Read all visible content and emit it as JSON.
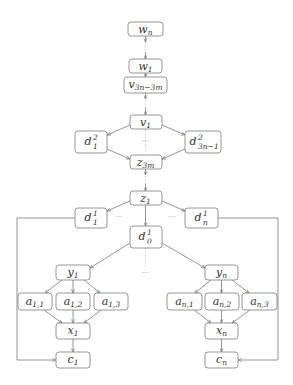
{
  "diagram": {
    "title": "",
    "nodes": [
      {
        "id": "wn",
        "base": "w",
        "sub": "n",
        "sup": ""
      },
      {
        "id": "w1",
        "base": "w",
        "sub": "1",
        "sup": ""
      },
      {
        "id": "v3n3m",
        "base": "v",
        "sub": "3n−3m",
        "sup": ""
      },
      {
        "id": "v1",
        "base": "v",
        "sub": "1",
        "sup": ""
      },
      {
        "id": "d2_1",
        "base": "d",
        "sub": "1",
        "sup": "2"
      },
      {
        "id": "d2_3n1",
        "base": "d",
        "sub": "3n−1",
        "sup": "2"
      },
      {
        "id": "z3m",
        "base": "z",
        "sub": "3m",
        "sup": ""
      },
      {
        "id": "z1",
        "base": "z",
        "sub": "1",
        "sup": ""
      },
      {
        "id": "d1_1",
        "base": "d",
        "sub": "1",
        "sup": "1"
      },
      {
        "id": "d1_n",
        "base": "d",
        "sub": "n",
        "sup": "1"
      },
      {
        "id": "d1_0",
        "base": "d",
        "sub": "0",
        "sup": "1"
      },
      {
        "id": "y1",
        "base": "y",
        "sub": "1",
        "sup": ""
      },
      {
        "id": "a11",
        "base": "a",
        "sub": "1,1",
        "sup": ""
      },
      {
        "id": "a12",
        "base": "a",
        "sub": "1,2",
        "sup": ""
      },
      {
        "id": "a13",
        "base": "a",
        "sub": "1,3",
        "sup": ""
      },
      {
        "id": "x1",
        "base": "x",
        "sub": "1",
        "sup": ""
      },
      {
        "id": "c1",
        "base": "c",
        "sub": "1",
        "sup": ""
      },
      {
        "id": "yn",
        "base": "y",
        "sub": "n",
        "sup": ""
      },
      {
        "id": "an1",
        "base": "a",
        "sub": "n,1",
        "sup": ""
      },
      {
        "id": "an2",
        "base": "a",
        "sub": "n,2",
        "sup": ""
      },
      {
        "id": "an3",
        "base": "a",
        "sub": "n,3",
        "sup": ""
      },
      {
        "id": "xn",
        "base": "x",
        "sub": "n",
        "sup": ""
      },
      {
        "id": "cn",
        "base": "c",
        "sub": "n",
        "sup": ""
      }
    ],
    "edges": [
      [
        "wn",
        "w1",
        "dotted"
      ],
      [
        "w1",
        "v3n3m",
        "solid"
      ],
      [
        "v3n3m",
        "v1",
        "dotted"
      ],
      [
        "v1",
        "d2_1",
        "solid"
      ],
      [
        "v1",
        "d2_3n1",
        "solid"
      ],
      [
        "d2_1",
        "z3m",
        "solid"
      ],
      [
        "d2_3n1",
        "z3m",
        "solid"
      ],
      [
        "z3m",
        "z1",
        "dotted"
      ],
      [
        "z1",
        "d1_1",
        "solid"
      ],
      [
        "z1",
        "d1_n",
        "solid"
      ],
      [
        "z1",
        "d1_0",
        "solid"
      ],
      [
        "d1_0",
        "y1",
        "solid"
      ],
      [
        "d1_0",
        "yn",
        "solid"
      ],
      [
        "y1",
        "a11",
        "solid"
      ],
      [
        "y1",
        "a12",
        "solid"
      ],
      [
        "y1",
        "a13",
        "solid"
      ],
      [
        "a11",
        "x1",
        "solid"
      ],
      [
        "a12",
        "x1",
        "solid"
      ],
      [
        "a13",
        "x1",
        "solid"
      ],
      [
        "x1",
        "c1",
        "solid"
      ],
      [
        "d1_1",
        "c1",
        "solid"
      ],
      [
        "yn",
        "an1",
        "solid"
      ],
      [
        "yn",
        "an2",
        "solid"
      ],
      [
        "yn",
        "an3",
        "solid"
      ],
      [
        "an1",
        "xn",
        "solid"
      ],
      [
        "an2",
        "xn",
        "solid"
      ],
      [
        "an3",
        "xn",
        "solid"
      ],
      [
        "xn",
        "cn",
        "solid"
      ],
      [
        "d1_n",
        "cn",
        "solid"
      ]
    ],
    "ellipsis": "···"
  }
}
